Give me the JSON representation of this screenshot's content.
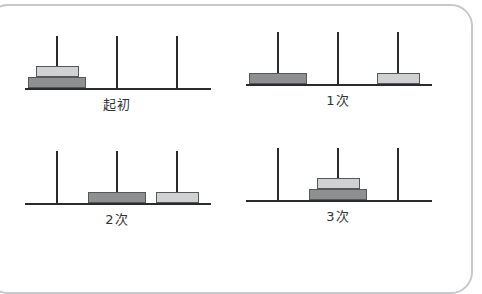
{
  "figure": {
    "type": "tower-of-hanoi-sequence",
    "peg_count": 3,
    "disk_count": 2,
    "frame_color": "#c6c8ca",
    "line_color": "#2b2b2b",
    "disk_large_color": "#8d8f91",
    "disk_small_color": "#cfd1d2",
    "disk_border_color": "#555759"
  },
  "panels": [
    {
      "caption": "起初",
      "step": 0,
      "pegs": [
        {
          "index": 1,
          "disks": [
            "large",
            "small"
          ]
        },
        {
          "index": 2,
          "disks": []
        },
        {
          "index": 3,
          "disks": []
        }
      ]
    },
    {
      "caption": "1次",
      "step": 1,
      "pegs": [
        {
          "index": 1,
          "disks": [
            "large"
          ]
        },
        {
          "index": 2,
          "disks": []
        },
        {
          "index": 3,
          "disks": [
            "small"
          ]
        }
      ]
    },
    {
      "caption": "2次",
      "step": 2,
      "pegs": [
        {
          "index": 1,
          "disks": []
        },
        {
          "index": 2,
          "disks": [
            "large"
          ]
        },
        {
          "index": 3,
          "disks": [
            "small"
          ]
        }
      ]
    },
    {
      "caption": "3次",
      "step": 3,
      "pegs": [
        {
          "index": 1,
          "disks": []
        },
        {
          "index": 2,
          "disks": [
            "large",
            "small"
          ]
        },
        {
          "index": 3,
          "disks": []
        }
      ]
    }
  ]
}
